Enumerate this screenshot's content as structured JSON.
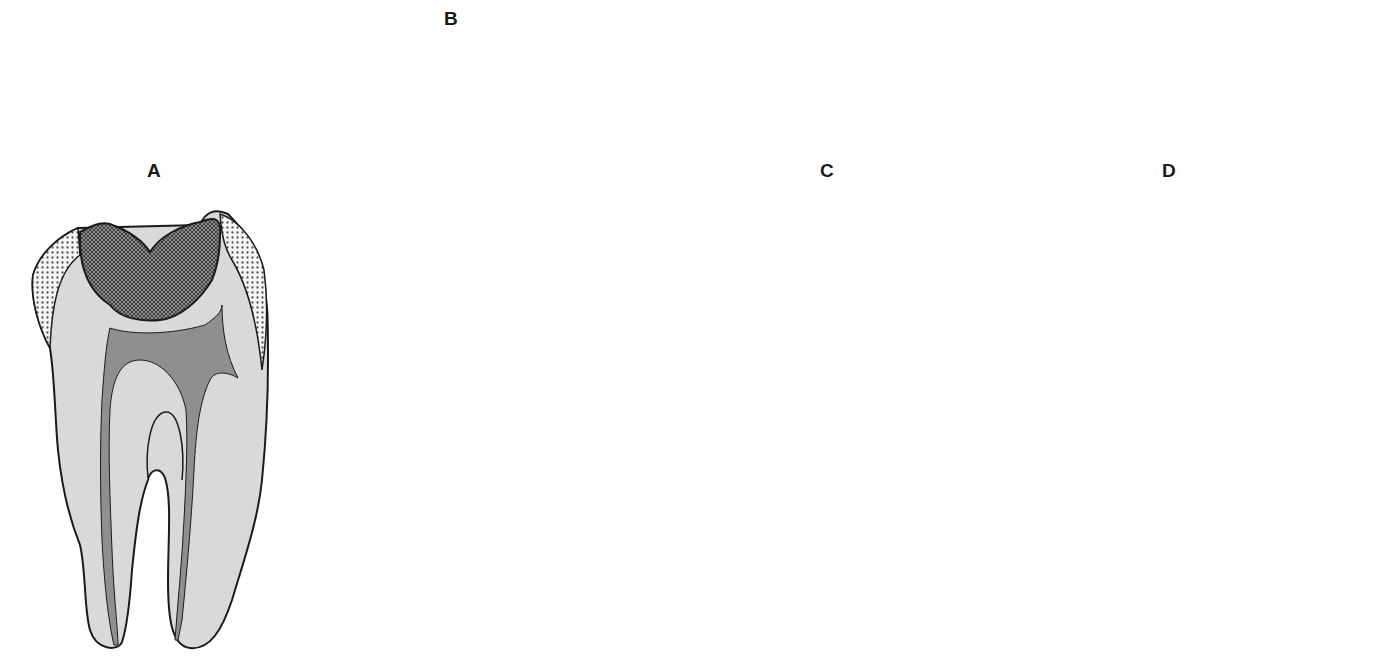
{
  "figure": {
    "panels": [
      {
        "id": "A",
        "label": "A",
        "content": "Molar with large occlusal lesion/restoration over pulp chamber; pulp (dark gray) in chamber and root canals"
      },
      {
        "id": "B",
        "label": "B",
        "content": "Access cavity opened; endodontic hand file (handle with stripes) inserted into root canal; canals shown instrumented"
      },
      {
        "id": "C",
        "label": "C",
        "content": "Pulp chamber filled with core material extending into canal; root canal filled (obturated)"
      },
      {
        "id": "D",
        "label": "D",
        "content": "Sectioned root with filled canal and coronal restoration, embedded in alveolar bone (trabecular pattern)"
      }
    ]
  },
  "colors": {
    "dentin": "#d9d9d9",
    "enamel_stipple_bg": "#f2f2f2",
    "enamel_dot": "#5a5a5a",
    "restoration": "#6e6e6e",
    "pulp": "#8f8f8f",
    "outline": "#1a1a1a",
    "file_handle": "#9a9a9a",
    "file_shaft": "#e6e6e6",
    "background": "#ffffff"
  }
}
